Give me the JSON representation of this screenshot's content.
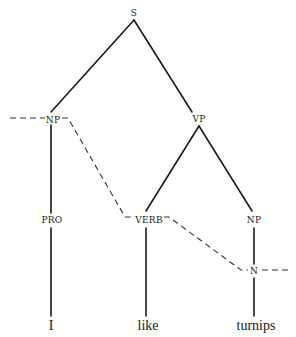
{
  "diagram": {
    "type": "syntax-tree",
    "nodes": {
      "s": {
        "label": "S",
        "x": 134,
        "y": 13
      },
      "np_subj": {
        "label": "NP",
        "x": 52,
        "y": 120
      },
      "vp": {
        "label": "VP",
        "x": 199,
        "y": 119
      },
      "pro": {
        "label": "PRO",
        "x": 52,
        "y": 220
      },
      "verb": {
        "label": "VERB",
        "x": 149,
        "y": 220
      },
      "np_obj": {
        "label": "NP",
        "x": 254,
        "y": 220
      },
      "n": {
        "label": "N",
        "x": 254,
        "y": 271
      }
    },
    "words": {
      "i": {
        "label": "I",
        "x": 51,
        "y": 326
      },
      "like": {
        "label": "like",
        "x": 148,
        "y": 326
      },
      "turnips": {
        "label": "turnips",
        "x": 256,
        "y": 326
      }
    },
    "solid_edges": [
      [
        "S",
        "NP"
      ],
      [
        "S",
        "VP"
      ],
      [
        "NP",
        "PRO"
      ],
      [
        "PRO",
        "I"
      ],
      [
        "VP",
        "VERB"
      ],
      [
        "VP",
        "NP"
      ],
      [
        "VERB",
        "like"
      ],
      [
        "NP",
        "N"
      ],
      [
        "N",
        "turnips"
      ]
    ],
    "dashed_path": [
      "(left edge)",
      "NP",
      "VERB",
      "N",
      "(right edge)"
    ],
    "line_color": "#1a1a1a"
  }
}
